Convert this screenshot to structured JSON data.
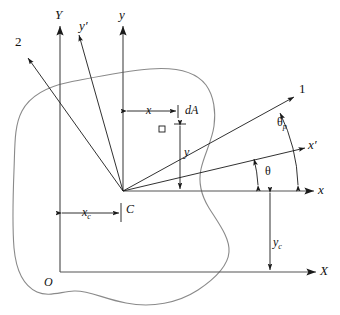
{
  "figure": {
    "type": "engineering-diagram",
    "width": 340,
    "height": 315,
    "background_color": "#ffffff",
    "line_color": "#1a1a1a",
    "outline_color": "#8a8a8a"
  },
  "labels": {
    "global_y_axis": "Y",
    "global_x_axis": "X",
    "origin": "O",
    "centroidal_y_axis": "y",
    "centroidal_x_axis": "x",
    "rotated_y_axis": "y′",
    "rotated_x_axis": "x′",
    "principal_axis_1": "1",
    "principal_axis_2": "2",
    "centroid": "C",
    "area_element": "dA",
    "dim_x": "x",
    "dim_y": "y",
    "dim_xc_base": "x",
    "dim_xc_sub": "c",
    "dim_yc_base": "y",
    "dim_yc_sub": "c",
    "angle_theta": "θ",
    "angle_theta_p_base": "θ",
    "angle_theta_p_sub": "p"
  },
  "geometry": {
    "centroid": {
      "x": 123,
      "y": 191
    },
    "global_origin": {
      "x": 60,
      "y": 272
    },
    "axes": [
      {
        "name": "global-Y",
        "x1": 60,
        "y1": 272,
        "x2": 60,
        "y2": 22
      },
      {
        "name": "global-X",
        "x1": 60,
        "y1": 272,
        "x2": 320,
        "y2": 272
      },
      {
        "name": "centroidal-y",
        "x1": 123,
        "y1": 191,
        "x2": 123,
        "y2": 22
      },
      {
        "name": "centroidal-x",
        "x1": 123,
        "y1": 191,
        "x2": 318,
        "y2": 191
      },
      {
        "name": "rotated-x-prime",
        "x1": 123,
        "y1": 191,
        "x2": 308,
        "y2": 147
      },
      {
        "name": "rotated-y-prime",
        "x1": 123,
        "y1": 191,
        "x2": 78,
        "y2": 32
      },
      {
        "name": "principal-1",
        "x1": 123,
        "y1": 191,
        "x2": 296,
        "y2": 96
      },
      {
        "name": "principal-2",
        "x1": 123,
        "y1": 191,
        "x2": 26,
        "y2": 56
      }
    ],
    "element_dA": {
      "x": 172,
      "y": 120,
      "size": 6
    },
    "dim_x_line": {
      "x1": 123,
      "y1": 111,
      "x2": 178,
      "y2": 111
    },
    "dim_y_line": {
      "x1": 180,
      "y1": 118,
      "x2": 180,
      "y2": 191
    },
    "dim_xc_line": {
      "x1": 60,
      "y1": 213,
      "x2": 123,
      "y2": 213
    },
    "dim_yc_line": {
      "x1": 270,
      "y1": 191,
      "x2": 270,
      "y2": 272
    },
    "arc_theta": {
      "cx": 123,
      "cy": 191,
      "radius": 135,
      "from_deg": 0,
      "to_deg": 13.4
    },
    "arc_theta_p": {
      "cx": 123,
      "cy": 191,
      "radius": 175,
      "from_deg": 0,
      "to_deg": 28.8
    }
  },
  "annotations": {
    "theta_description": "angle from x axis to rotated x′ axis",
    "theta_p_description": "principal angle from x axis to principal axis 1"
  }
}
